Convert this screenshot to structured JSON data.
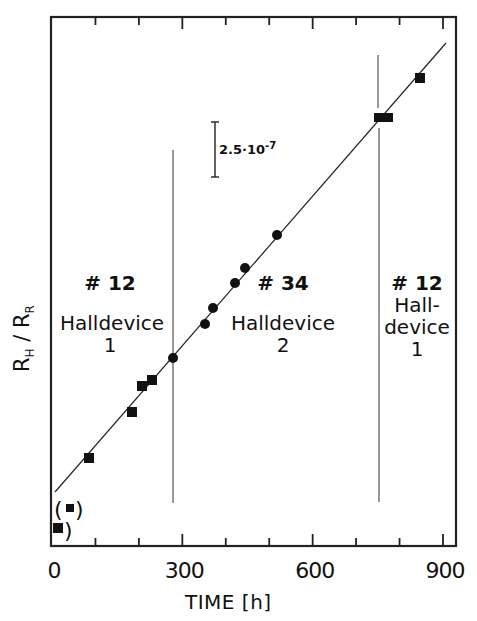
{
  "chart_data": {
    "type": "scatter",
    "title": "",
    "xlabel": "TIME [h]",
    "ylabel": "R_H / R_R",
    "ylabel_main": "R",
    "ylabel_sub1": "H",
    "ylabel_sep": " / ",
    "ylabel_sub2": "R",
    "xlim": [
      0,
      930
    ],
    "x_ticks": [
      "0",
      "300",
      "600",
      "900"
    ],
    "x_minor_ticks": [
      100,
      200,
      400,
      500,
      700,
      800
    ],
    "scale_bar": {
      "label": "2.5·10",
      "exponent": "-7",
      "value": 2.5e-07
    },
    "dividers_x": [
      275,
      750
    ],
    "series": [
      {
        "name": "#12 Halldevice 1 (before)",
        "marker": "square",
        "x": [
          85,
          185,
          210,
          230
        ],
        "y_rel": [
          0.4,
          0.61,
          0.72,
          0.76
        ]
      },
      {
        "name": "#34 Halldevice 2",
        "marker": "circle",
        "x": [
          278,
          350,
          370,
          420,
          445,
          515
        ],
        "y_rel": [
          0.85,
          1.01,
          1.08,
          1.19,
          1.26,
          1.41
        ]
      },
      {
        "name": "#12 Halldevice 1 (after)",
        "marker": "square",
        "x": [
          760,
          850
        ],
        "y_rel": [
          1.95,
          2.12
        ]
      },
      {
        "name": "excluded (parenthesized)",
        "marker": "square",
        "x": [
          40,
          10
        ],
        "y_rel": [
          0.17,
          0.08
        ]
      }
    ],
    "fit_line": {
      "x": [
        0,
        900
      ],
      "y_rel": [
        0.25,
        2.27
      ]
    },
    "y_units_note": "y_rel in units of 2.5e-7 per 0.25 (relative, offset arbitrary)",
    "annotations": [
      {
        "text1": "# 12",
        "text2": "Halldevice",
        "text3": "1"
      },
      {
        "text1": "# 34",
        "text2": "Halldevice",
        "text3": "2"
      },
      {
        "text1": "# 12",
        "text2": "Hall-",
        "text3": "device",
        "text4": "1"
      }
    ]
  }
}
